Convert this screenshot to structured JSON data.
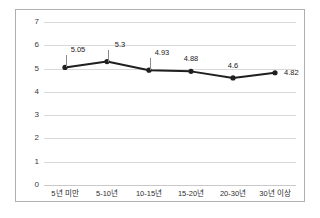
{
  "chart_data": {
    "type": "line",
    "title": "",
    "subtitle": "",
    "xlabel": "",
    "ylabel": "",
    "categories": [
      "5년 미만",
      "5-10년",
      "10-15년",
      "15-20년",
      "20-30년",
      "30년 이상"
    ],
    "values": [
      5.05,
      5.3,
      4.93,
      4.88,
      4.6,
      4.82
    ],
    "data_labels": [
      "5.05",
      "5.3",
      "4.93",
      "4.88",
      "4.6",
      "4.82"
    ],
    "series": [
      {
        "name": "",
        "values": [
          5.05,
          5.3,
          4.93,
          4.88,
          4.6,
          4.82
        ]
      }
    ],
    "ylim": [
      0,
      7
    ],
    "yticks": [
      0,
      1,
      2,
      3,
      4,
      5,
      6,
      7
    ],
    "ytick_labels": [
      "0",
      "1",
      "2",
      "3",
      "4",
      "5",
      "6",
      "7"
    ],
    "grid": true,
    "grid_axis": "y",
    "legend": false,
    "legend_position": "none",
    "marker": "circle",
    "line_color": "#1f1f1f",
    "marker_color": "#1f1f1f",
    "grid_color": "#d9d9d9",
    "border_color": "#b0b0b0",
    "background_color": "#ffffff",
    "label_color": "#1a1a1a"
  }
}
